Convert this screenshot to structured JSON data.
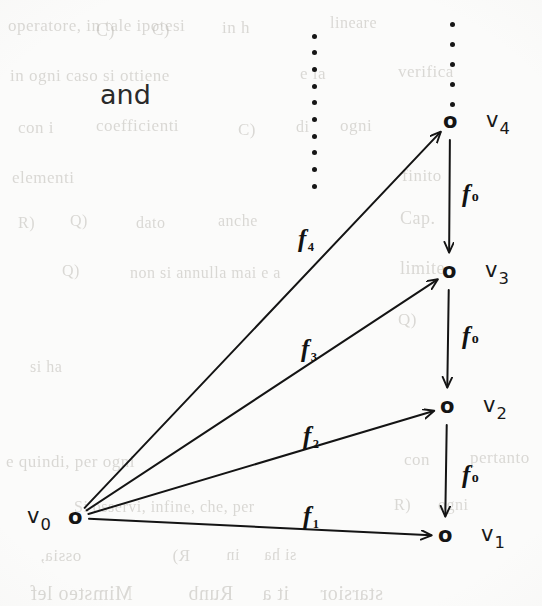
{
  "page": {
    "width": 542,
    "height": 606,
    "background_color": "#fbfbfa",
    "ink_color": "#141414",
    "connective_word": "and"
  },
  "chart_data": {
    "type": "diagram",
    "title": "",
    "subtitle": "",
    "diagram_kind": "commutative-diagram",
    "nodes": [
      {
        "id": "v0",
        "glyph": "o",
        "label": "v",
        "subscript": "0",
        "x": 75,
        "y": 518
      },
      {
        "id": "v1",
        "glyph": "o",
        "label": "v",
        "subscript": "1",
        "x": 445,
        "y": 536
      },
      {
        "id": "v2",
        "glyph": "o",
        "label": "v",
        "subscript": "2",
        "x": 447,
        "y": 407
      },
      {
        "id": "v3",
        "glyph": "o",
        "label": "v",
        "subscript": "3",
        "x": 449,
        "y": 272
      },
      {
        "id": "v4",
        "glyph": "o",
        "label": "v",
        "subscript": "4",
        "x": 450,
        "y": 122
      }
    ],
    "edges": [
      {
        "id": "f1",
        "from": "v0",
        "to": "v1",
        "label": "f",
        "subscript": "1",
        "style": "solid-arrow",
        "label_x": 303,
        "label_y": 503
      },
      {
        "id": "f2",
        "from": "v0",
        "to": "v2",
        "label": "f",
        "subscript": "2",
        "style": "solid-arrow",
        "label_x": 303,
        "label_y": 423
      },
      {
        "id": "f3",
        "from": "v0",
        "to": "v3",
        "label": "f",
        "subscript": "3",
        "style": "solid-arrow",
        "label_x": 301,
        "label_y": 336
      },
      {
        "id": "f4",
        "from": "v0",
        "to": "v4",
        "label": "f",
        "subscript": "4",
        "style": "solid-arrow",
        "label_x": 298,
        "label_y": 226
      },
      {
        "id": "f0-43",
        "from": "v4",
        "to": "v3",
        "label": "f",
        "subscript": "o",
        "style": "solid-arrow",
        "label_x": 462,
        "label_y": 181
      },
      {
        "id": "f0-32",
        "from": "v3",
        "to": "v2",
        "label": "f",
        "subscript": "o",
        "style": "solid-arrow",
        "label_x": 462,
        "label_y": 323
      },
      {
        "id": "f0-21",
        "from": "v2",
        "to": "v1",
        "label": "f",
        "subscript": "o",
        "style": "solid-arrow",
        "label_x": 462,
        "label_y": 462
      }
    ],
    "ellipses": [
      {
        "id": "left-vertical-dots",
        "x": 314,
        "y_start": 36,
        "y_end": 186,
        "count": 10,
        "orientation": "vertical"
      },
      {
        "id": "right-vertical-dots",
        "x": 452,
        "y_start": 24,
        "y_end": 104,
        "count": 5,
        "orientation": "vertical"
      }
    ]
  },
  "bleed_through": {
    "note": "faint show-through text from the reverse side of the page",
    "lines": [
      {
        "text": "operatore, in tale ipotesi",
        "x": 8,
        "y": 16,
        "size": 17,
        "mirrored": false
      },
      {
        "text": "C)",
        "x": 96,
        "y": 20,
        "size": 18,
        "mirrored": false
      },
      {
        "text": "C)",
        "x": 152,
        "y": 20,
        "size": 17,
        "mirrored": false
      },
      {
        "text": "in h",
        "x": 222,
        "y": 18,
        "size": 17,
        "mirrored": false
      },
      {
        "text": "lineare",
        "x": 330,
        "y": 14,
        "size": 16,
        "mirrored": false
      },
      {
        "text": "in ogni caso si ottiene",
        "x": 10,
        "y": 66,
        "size": 17,
        "mirrored": false
      },
      {
        "text": "e la",
        "x": 300,
        "y": 64,
        "size": 17,
        "mirrored": false
      },
      {
        "text": "verifica",
        "x": 398,
        "y": 62,
        "size": 17,
        "mirrored": false
      },
      {
        "text": "con i",
        "x": 18,
        "y": 118,
        "size": 17,
        "mirrored": false
      },
      {
        "text": "coefficienti",
        "x": 96,
        "y": 116,
        "size": 17,
        "mirrored": false
      },
      {
        "text": "C)",
        "x": 238,
        "y": 120,
        "size": 17,
        "mirrored": false
      },
      {
        "text": "di",
        "x": 296,
        "y": 118,
        "size": 16,
        "mirrored": false
      },
      {
        "text": "ogni",
        "x": 340,
        "y": 116,
        "size": 17,
        "mirrored": false
      },
      {
        "text": "elementi",
        "x": 12,
        "y": 168,
        "size": 17,
        "mirrored": false
      },
      {
        "text": "finito",
        "x": 402,
        "y": 166,
        "size": 17,
        "mirrored": false
      },
      {
        "text": "R)",
        "x": 18,
        "y": 214,
        "size": 16,
        "mirrored": false
      },
      {
        "text": "Q)",
        "x": 70,
        "y": 212,
        "size": 16,
        "mirrored": false
      },
      {
        "text": "dato",
        "x": 136,
        "y": 214,
        "size": 16,
        "mirrored": false
      },
      {
        "text": "anche",
        "x": 218,
        "y": 212,
        "size": 16,
        "mirrored": false
      },
      {
        "text": "Cap.",
        "x": 400,
        "y": 208,
        "size": 18,
        "mirrored": false
      },
      {
        "text": "Q)",
        "x": 62,
        "y": 262,
        "size": 16,
        "mirrored": false
      },
      {
        "text": "non si annulla mai e a",
        "x": 130,
        "y": 264,
        "size": 16,
        "mirrored": false
      },
      {
        "text": "limite",
        "x": 400,
        "y": 258,
        "size": 18,
        "mirrored": false
      },
      {
        "text": "Q)",
        "x": 398,
        "y": 310,
        "size": 17,
        "mirrored": false
      },
      {
        "text": "si ha",
        "x": 30,
        "y": 358,
        "size": 16,
        "mirrored": false
      },
      {
        "text": "e quindi, per ogni",
        "x": 6,
        "y": 452,
        "size": 17,
        "mirrored": false
      },
      {
        "text": "con",
        "x": 404,
        "y": 450,
        "size": 17,
        "mirrored": false
      },
      {
        "text": "pertanto",
        "x": 470,
        "y": 448,
        "size": 17,
        "mirrored": false
      },
      {
        "text": "Si osservi, infine, che, per",
        "x": 74,
        "y": 498,
        "size": 16,
        "mirrored": false
      },
      {
        "text": "R)",
        "x": 394,
        "y": 496,
        "size": 16,
        "mirrored": false
      },
      {
        "text": "ogni",
        "x": 438,
        "y": 496,
        "size": 16,
        "mirrored": false
      },
      {
        "text": "ossia,",
        "x": 40,
        "y": 546,
        "size": 17,
        "mirrored": true
      },
      {
        "text": "R)",
        "x": 172,
        "y": 546,
        "size": 17,
        "mirrored": true
      },
      {
        "text": "in",
        "x": 226,
        "y": 546,
        "size": 16,
        "mirrored": true
      },
      {
        "text": "si ha",
        "x": 264,
        "y": 546,
        "size": 16,
        "mirrored": true
      },
      {
        "text": "Mimsteo lef",
        "x": 30,
        "y": 582,
        "size": 20,
        "mirrored": true
      },
      {
        "text": "Runb",
        "x": 188,
        "y": 582,
        "size": 20,
        "mirrored": true
      },
      {
        "text": "it a",
        "x": 262,
        "y": 582,
        "size": 20,
        "mirrored": true
      },
      {
        "text": "starsior",
        "x": 320,
        "y": 582,
        "size": 20,
        "mirrored": true
      }
    ]
  }
}
